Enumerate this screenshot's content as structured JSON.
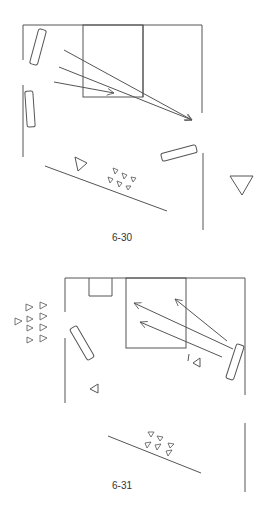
{
  "figures": [
    {
      "caption": "6-30",
      "caption_pos": [
        112,
        238
      ]
    },
    {
      "caption": "6-31",
      "caption_pos": [
        112,
        486
      ]
    }
  ],
  "colors": {
    "line": "#555555",
    "background": "#ffffff"
  }
}
